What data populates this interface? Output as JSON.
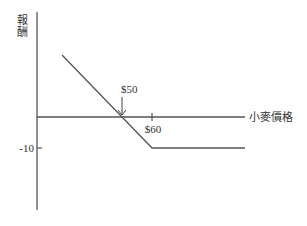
{
  "chart_data": {
    "type": "line",
    "title": "",
    "xlabel": "小麥價格",
    "ylabel": "報酬",
    "x_range": [
      20,
      92
    ],
    "y_range": [
      -30,
      34
    ],
    "grid": false,
    "legend": "none",
    "series": [
      {
        "name": "payoff",
        "x": [
          30,
          50,
          60,
          91
        ],
        "y": [
          20,
          0,
          -10,
          -10
        ]
      }
    ],
    "x_ticks": [
      {
        "value": 60,
        "label": "$60"
      }
    ],
    "y_ticks": [
      {
        "value": -10,
        "label": "-10"
      }
    ],
    "annotations": [
      {
        "label": "$50",
        "x": 50,
        "y": 0,
        "arrow": "down"
      }
    ],
    "color": "#555555"
  }
}
